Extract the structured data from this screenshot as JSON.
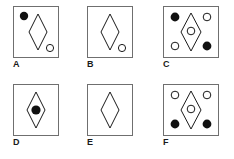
{
  "figure": {
    "title": "",
    "stroke_color": "#1a1a1a",
    "box_border_color": "#6f6f6f",
    "fill_color": "#111111",
    "background_color": "#ffffff",
    "panels": [
      {
        "label": "A",
        "diamond": {
          "cx": 25,
          "cy": 26,
          "rx": 9,
          "ry": 18
        },
        "circles": [
          {
            "name": "filled-circle-top-left",
            "cx": 11,
            "cy": 10,
            "r": 4.2,
            "fill": "filled"
          },
          {
            "name": "open-circle-bottom-right",
            "cx": 37,
            "cy": 42,
            "r": 3.6,
            "fill": "open"
          }
        ]
      },
      {
        "label": "B",
        "diamond": {
          "cx": 23,
          "cy": 26,
          "rx": 9,
          "ry": 18
        },
        "circles": [
          {
            "name": "open-circle-bottom-right",
            "cx": 35,
            "cy": 42,
            "r": 3.6,
            "fill": "open"
          }
        ]
      },
      {
        "label": "C",
        "diamond": {
          "cx": 28,
          "cy": 26,
          "rx": 10,
          "ry": 19
        },
        "circles": [
          {
            "name": "filled-circle-top-left",
            "cx": 12,
            "cy": 11,
            "r": 4.4,
            "fill": "filled"
          },
          {
            "name": "open-circle-top-right",
            "cx": 44,
            "cy": 11,
            "r": 3.8,
            "fill": "open"
          },
          {
            "name": "open-circle-center",
            "cx": 28,
            "cy": 25,
            "r": 3.8,
            "fill": "open"
          },
          {
            "name": "open-circle-bottom-left",
            "cx": 12,
            "cy": 40,
            "r": 3.8,
            "fill": "open"
          },
          {
            "name": "filled-circle-bottom-right",
            "cx": 44,
            "cy": 40,
            "r": 4.4,
            "fill": "filled"
          }
        ]
      },
      {
        "label": "D",
        "diamond": {
          "cx": 23,
          "cy": 26,
          "rx": 9,
          "ry": 18
        },
        "circles": [
          {
            "name": "filled-circle-center",
            "cx": 23,
            "cy": 26,
            "r": 4.6,
            "fill": "filled"
          }
        ]
      },
      {
        "label": "E",
        "diamond": {
          "cx": 23,
          "cy": 26,
          "rx": 9,
          "ry": 18
        },
        "circles": []
      },
      {
        "label": "F",
        "diamond": {
          "cx": 28,
          "cy": 26,
          "rx": 10,
          "ry": 19
        },
        "circles": [
          {
            "name": "open-circle-top-left",
            "cx": 12,
            "cy": 11,
            "r": 3.8,
            "fill": "open"
          },
          {
            "name": "open-circle-top-right",
            "cx": 44,
            "cy": 11,
            "r": 3.8,
            "fill": "open"
          },
          {
            "name": "open-circle-center",
            "cx": 28,
            "cy": 25,
            "r": 3.8,
            "fill": "open"
          },
          {
            "name": "filled-circle-bottom-left",
            "cx": 12,
            "cy": 40,
            "r": 4.4,
            "fill": "filled"
          },
          {
            "name": "filled-circle-bottom-right",
            "cx": 44,
            "cy": 40,
            "r": 4.4,
            "fill": "filled"
          }
        ]
      }
    ]
  }
}
